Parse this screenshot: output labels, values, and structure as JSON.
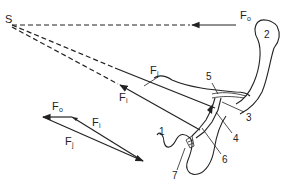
{
  "diagram": {
    "point_label": "S",
    "forces": {
      "Fo": {
        "main": "F",
        "sub": "o"
      },
      "Fj": {
        "main": "F",
        "sub": "j"
      },
      "Fi": {
        "main": "F",
        "sub": "i"
      }
    },
    "triangle": {
      "Fo": {
        "main": "F",
        "sub": "o"
      },
      "Fi": {
        "main": "F",
        "sub": "i"
      },
      "Fj": {
        "main": "F",
        "sub": "j"
      }
    },
    "numbers": [
      "1",
      "2",
      "3",
      "4",
      "5",
      "6",
      "7"
    ]
  }
}
